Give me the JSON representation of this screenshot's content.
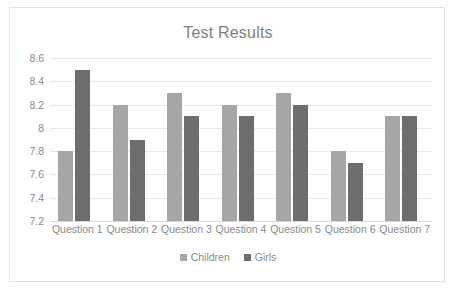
{
  "chart_data": {
    "type": "bar",
    "title": "Test Results",
    "xlabel": "",
    "ylabel": "",
    "categories": [
      "Question 1",
      "Question 2",
      "Question 3",
      "Question 4",
      "Question 5",
      "Question 6",
      "Question 7"
    ],
    "series": [
      {
        "name": "Children",
        "color": "#a6a6a6",
        "values": [
          7.8,
          8.2,
          8.3,
          8.2,
          8.3,
          7.8,
          8.1
        ]
      },
      {
        "name": "Girls",
        "color": "#6e6e6e",
        "values": [
          8.5,
          7.9,
          8.1,
          8.1,
          8.2,
          7.7,
          8.1
        ]
      }
    ],
    "ylim": [
      7.2,
      8.6
    ],
    "ytick_labels": [
      "8.6",
      "8.4",
      "8.2",
      "8",
      "7.8",
      "7.6",
      "7.4",
      "7.2"
    ],
    "ytick_values": [
      8.6,
      8.4,
      8.2,
      8.0,
      7.8,
      7.6,
      7.4,
      7.2
    ],
    "grid": true,
    "legend_position": "bottom",
    "plot_background": "#ffffff",
    "grid_color": "#e9e9e9",
    "text_color": "#8a8a8a",
    "border_color": "#e4e4e4"
  }
}
